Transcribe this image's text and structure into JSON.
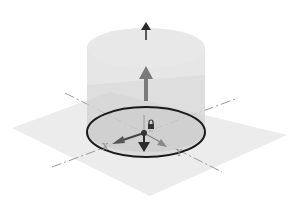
{
  "diagram": {
    "colors": {
      "background": "#ffffff",
      "plane": "#ececec",
      "cylinder_body": "#dcdcdc",
      "cylinder_top": "#e6e6e6",
      "sketch_circle": "#1a1a1a",
      "axis_dash": "#9a9a9a",
      "arrow_dark": "#2a2a2a",
      "arrow_gray": "#7a7a7a"
    },
    "axes": {
      "x_label": "X",
      "y_label": "Y"
    },
    "elements": {
      "plane": "sketch-plane",
      "circle": "sketch-circle-profile",
      "cylinder": "extrusion-preview",
      "arrow_top": "extrude-direction-arrow",
      "arrow_middle": "extrude-distance-handle",
      "arrow_down": "normal-axis-arrow",
      "origin": "origin-point",
      "lock": "lock-icon"
    }
  }
}
